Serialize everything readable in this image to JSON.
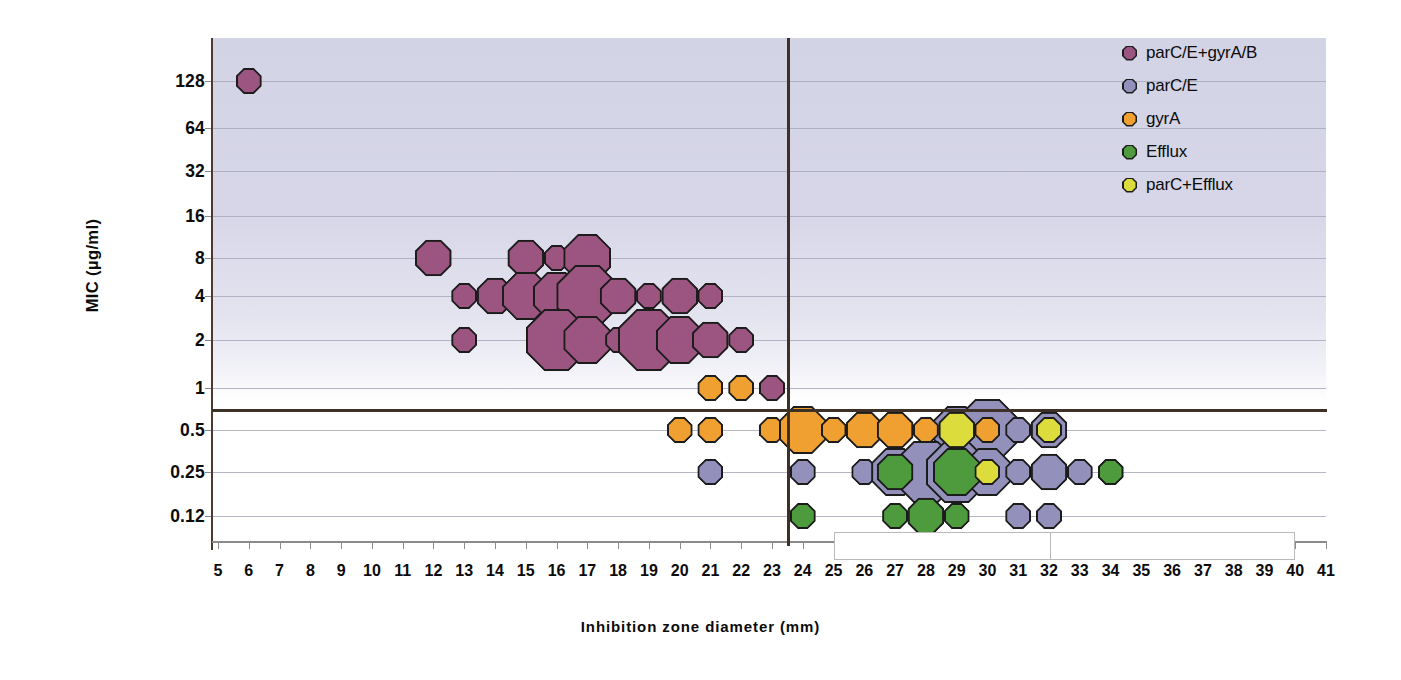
{
  "chart_data": {
    "type": "scatter",
    "title": "",
    "xlabel": "Inhibition zone diameter (mm)",
    "ylabel": "MIC (µg/ml)",
    "xlim": [
      5,
      41
    ],
    "xticks": [
      5,
      6,
      7,
      8,
      9,
      10,
      11,
      12,
      13,
      14,
      15,
      16,
      17,
      18,
      19,
      20,
      21,
      22,
      23,
      24,
      25,
      26,
      27,
      28,
      29,
      30,
      31,
      32,
      33,
      34,
      35,
      36,
      37,
      38,
      39,
      40,
      41
    ],
    "yticks": [
      "128",
      "64",
      "32",
      "16",
      "8",
      "4",
      "2",
      "1",
      "0.5",
      "0.25",
      "0.12"
    ],
    "yvalues": [
      128,
      64,
      32,
      16,
      8,
      4,
      2,
      1,
      0.5,
      0.25,
      0.12
    ],
    "grid": true,
    "legend_position": "top-right",
    "thresholds": {
      "mic_breakpoint_label": "0.7",
      "mic_breakpoint_value": 0.7,
      "zone_breakpoint_value": 23.5
    },
    "series": [
      {
        "name": "parC/E+gyrA/B",
        "color": "#9C5580",
        "points": [
          {
            "x": 6,
            "y": 128,
            "n": 1
          },
          {
            "x": 12,
            "y": 8,
            "n": 2
          },
          {
            "x": 15,
            "y": 8,
            "n": 2
          },
          {
            "x": 16,
            "y": 8,
            "n": 1
          },
          {
            "x": 17,
            "y": 8,
            "n": 3
          },
          {
            "x": 13,
            "y": 4,
            "n": 1
          },
          {
            "x": 14,
            "y": 4,
            "n": 2
          },
          {
            "x": 15,
            "y": 4,
            "n": 3
          },
          {
            "x": 16,
            "y": 4,
            "n": 3
          },
          {
            "x": 17,
            "y": 4,
            "n": 4
          },
          {
            "x": 18,
            "y": 4,
            "n": 2
          },
          {
            "x": 19,
            "y": 4,
            "n": 1
          },
          {
            "x": 20,
            "y": 4,
            "n": 2
          },
          {
            "x": 21,
            "y": 4,
            "n": 1
          },
          {
            "x": 13,
            "y": 2,
            "n": 1
          },
          {
            "x": 16,
            "y": 2,
            "n": 4
          },
          {
            "x": 17,
            "y": 2,
            "n": 3
          },
          {
            "x": 18,
            "y": 2,
            "n": 1
          },
          {
            "x": 19,
            "y": 2,
            "n": 4
          },
          {
            "x": 20,
            "y": 2,
            "n": 3
          },
          {
            "x": 21,
            "y": 2,
            "n": 2
          },
          {
            "x": 22,
            "y": 2,
            "n": 1
          },
          {
            "x": 23,
            "y": 1,
            "n": 1
          }
        ]
      },
      {
        "name": "parC/E",
        "color": "#9490BC",
        "points": [
          {
            "x": 29,
            "y": 0.5,
            "n": 3
          },
          {
            "x": 30,
            "y": 0.5,
            "n": 4
          },
          {
            "x": 31,
            "y": 0.5,
            "n": 1
          },
          {
            "x": 32,
            "y": 0.5,
            "n": 2
          },
          {
            "x": 21,
            "y": 0.25,
            "n": 1
          },
          {
            "x": 24,
            "y": 0.25,
            "n": 1
          },
          {
            "x": 26,
            "y": 0.25,
            "n": 1
          },
          {
            "x": 27,
            "y": 0.25,
            "n": 3
          },
          {
            "x": 28,
            "y": 0.25,
            "n": 4
          },
          {
            "x": 29,
            "y": 0.25,
            "n": 4
          },
          {
            "x": 30,
            "y": 0.25,
            "n": 3
          },
          {
            "x": 31,
            "y": 0.25,
            "n": 1
          },
          {
            "x": 32,
            "y": 0.25,
            "n": 2
          },
          {
            "x": 33,
            "y": 0.25,
            "n": 1
          },
          {
            "x": 34,
            "y": 0.25,
            "n": 1
          },
          {
            "x": 31,
            "y": 0.12,
            "n": 1
          },
          {
            "x": 32,
            "y": 0.12,
            "n": 1
          }
        ]
      },
      {
        "name": "gyrA",
        "color": "#F0A030",
        "points": [
          {
            "x": 21,
            "y": 1,
            "n": 1
          },
          {
            "x": 22,
            "y": 1,
            "n": 1
          },
          {
            "x": 20,
            "y": 0.5,
            "n": 1
          },
          {
            "x": 21,
            "y": 0.5,
            "n": 1
          },
          {
            "x": 23,
            "y": 0.5,
            "n": 1
          },
          {
            "x": 24,
            "y": 0.5,
            "n": 3
          },
          {
            "x": 25,
            "y": 0.5,
            "n": 1
          },
          {
            "x": 26,
            "y": 0.5,
            "n": 2
          },
          {
            "x": 27,
            "y": 0.5,
            "n": 2
          },
          {
            "x": 28,
            "y": 0.5,
            "n": 1
          },
          {
            "x": 30,
            "y": 0.5,
            "n": 1
          }
        ]
      },
      {
        "name": "Efflux",
        "color": "#4E9B3D",
        "points": [
          {
            "x": 27,
            "y": 0.25,
            "n": 2
          },
          {
            "x": 29,
            "y": 0.25,
            "n": 3
          },
          {
            "x": 34,
            "y": 0.25,
            "n": 1
          },
          {
            "x": 24,
            "y": 0.12,
            "n": 1
          },
          {
            "x": 27,
            "y": 0.12,
            "n": 1
          },
          {
            "x": 28,
            "y": 0.12,
            "n": 2
          },
          {
            "x": 29,
            "y": 0.12,
            "n": 1
          }
        ]
      },
      {
        "name": "parC+Efflux",
        "color": "#DCDC3C",
        "points": [
          {
            "x": 29,
            "y": 0.5,
            "n": 2
          },
          {
            "x": 32,
            "y": 0.5,
            "n": 1
          },
          {
            "x": 30,
            "y": 0.25,
            "n": 1
          }
        ]
      }
    ]
  },
  "legend": {
    "items": [
      {
        "label": "parC/E+gyrA/B",
        "color": "#9C5580"
      },
      {
        "label": "parC/E",
        "color": "#9490BC"
      },
      {
        "label": "gyrA",
        "color": "#F0A030"
      },
      {
        "label": "Efflux",
        "color": "#4E9B3D"
      },
      {
        "label": "parC+Efflux",
        "color": "#DCDC3C"
      }
    ]
  },
  "annotation_box": {
    "text": "",
    "x_start": 25,
    "x_end": 40,
    "divider_at": 32
  }
}
